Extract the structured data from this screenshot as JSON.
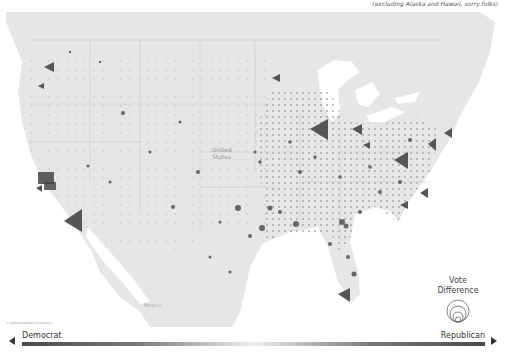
{
  "subtitle": "(excluding Alaska and Hawaii, sorry folks)",
  "map": {
    "country_label": "United States",
    "places": [
      {
        "name": "Mexico",
        "x": 144,
        "y": 295
      }
    ],
    "background_color": "#e8e8e8",
    "water_color": "#ffffff",
    "marker_color": "#555555"
  },
  "legend": {
    "title_line1": "Vote",
    "title_line2": "Difference"
  },
  "scale": {
    "left_label": "Democrat",
    "right_label": "Republican",
    "dark_color": "#4a4a4a",
    "mid_color": "#eeeeee"
  },
  "attribution": "© OpenStreetMap contributors"
}
